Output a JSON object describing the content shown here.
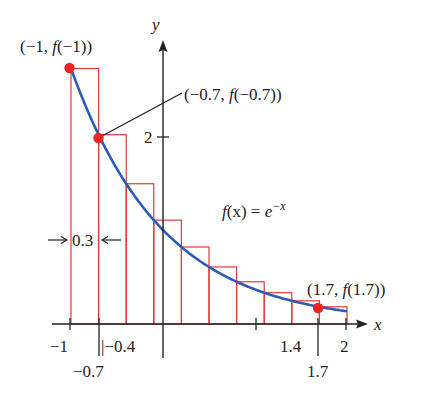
{
  "chart_data": {
    "type": "line",
    "title": "",
    "function_label": "f(x) = e^-x",
    "function_label_parts": {
      "lhs": "f(x) = e",
      "exp": "−x"
    },
    "xlabel": "x",
    "ylabel": "y",
    "xlim": [
      -1,
      2
    ],
    "ylim": [
      0,
      2.9
    ],
    "x_ticks": [
      -1,
      -0.7,
      -0.4,
      1.4,
      1.7,
      2
    ],
    "x_tick_labels": [
      "−1",
      "−0.7",
      "−0.4",
      "1.4",
      "1.7",
      "2"
    ],
    "y_ticks": [
      2
    ],
    "y_tick_labels": [
      "2"
    ],
    "curve": {
      "name": "f(x) = e^-x",
      "color": "#2b5db8",
      "x": [
        -1,
        -0.7,
        -0.4,
        -0.1,
        0.2,
        0.5,
        0.8,
        1.1,
        1.4,
        1.7,
        2.0
      ],
      "y": [
        2.718,
        2.014,
        1.492,
        1.105,
        0.819,
        0.607,
        0.449,
        0.333,
        0.247,
        0.183,
        0.135
      ]
    },
    "rectangles": {
      "type": "left-endpoint Riemann sum",
      "color": "#e03a3a",
      "width": 0.3,
      "left_x": [
        -1,
        -0.7,
        -0.4,
        -0.1,
        0.2,
        0.5,
        0.8,
        1.1,
        1.4,
        1.7
      ],
      "heights": [
        2.718,
        2.014,
        1.492,
        1.105,
        0.819,
        0.607,
        0.449,
        0.333,
        0.247,
        0.183
      ]
    },
    "highlighted_points": [
      {
        "x": -1,
        "y": 2.718,
        "label": "(−1, f(−1))"
      },
      {
        "x": -0.7,
        "y": 2.014,
        "label": "(−0.7, f(−0.7))"
      },
      {
        "x": 1.7,
        "y": 0.183,
        "label": "(1.7, f(1.7))"
      }
    ],
    "annotations": [
      {
        "text": "0.3",
        "meaning": "rectangle width Δx"
      }
    ],
    "grid": false,
    "legend": "none"
  },
  "labels": {
    "y_axis": "y",
    "x_axis": "x",
    "point_a": "(−1, ",
    "point_a_f": "f",
    "point_a_tail": "(−1))",
    "point_b": "(−0.7, ",
    "point_b_f": "f",
    "point_b_tail": "(−0.7))",
    "point_c": "(1.7, ",
    "point_c_f": "f",
    "point_c_tail": "(1.7))",
    "func_f": "f",
    "func_mid": "(x) = ",
    "func_e": "e",
    "func_exp": "−x",
    "width_label": "0.3",
    "tick_neg1": "−1",
    "tick_neg07": "−0.7",
    "tick_neg04": "|−0.4",
    "tick_14": "1.4",
    "tick_17": "1.7",
    "tick_2": "2",
    "ytick_2": "2"
  },
  "colors": {
    "curve": "#2b5db8",
    "rect": "#e03a3a",
    "point": "#ee2222",
    "axis": "#222222"
  }
}
